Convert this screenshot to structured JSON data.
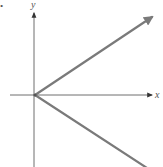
{
  "figure": {
    "marker": "•",
    "axes": {
      "x_label": "x",
      "y_label": "y"
    },
    "rays": [
      {
        "name": "upper-ray",
        "direction": "up-right",
        "arrowhead": true
      },
      {
        "name": "lower-ray",
        "direction": "down-right",
        "arrowhead": false
      }
    ],
    "colors": {
      "axis": "#6e6e6e",
      "ray": "#7a7a7a",
      "background": "#ffffff"
    }
  }
}
